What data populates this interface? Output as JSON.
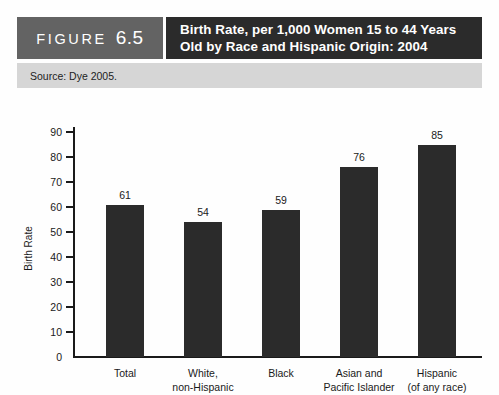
{
  "figure": {
    "word": "FIGURE",
    "number": "6.5",
    "title_line1": "Birth Rate, per 1,000 Women 15 to 44 Years",
    "title_line2": "Old by Race and Hispanic Origin: 2004"
  },
  "source": {
    "text": "Source: Dye 2005."
  },
  "colors": {
    "figure_box": "#636363",
    "title_box": "#2b2b2b",
    "source_band": "#d6d6d6",
    "bar": "#2b2b2b",
    "axis": "#1a1a1a"
  },
  "chart_data": {
    "type": "bar",
    "title": "Birth Rate, per 1,000 Women 15 to 44 Years Old by Race and Hispanic Origin: 2004",
    "categories": [
      "Total",
      "White,\nnon-Hispanic",
      "Black",
      "Asian and\nPacific Islander",
      "Hispanic\n(of any race)"
    ],
    "category_lines": [
      [
        "Total"
      ],
      [
        "White,",
        "non-Hispanic"
      ],
      [
        "Black"
      ],
      [
        "Asian and",
        "Pacific Islander"
      ],
      [
        "Hispanic",
        "(of any race)"
      ]
    ],
    "values": [
      61,
      54,
      59,
      76,
      85
    ],
    "value_labels": [
      "61",
      "54",
      "59",
      "76",
      "85"
    ],
    "xlabel": "",
    "ylabel": "Birth Rate",
    "ylim": [
      0,
      90
    ],
    "ytick_values": [
      0,
      10,
      20,
      30,
      40,
      50,
      60,
      70,
      80,
      90
    ],
    "ytick_labels": [
      "0",
      "10",
      "20",
      "30",
      "40",
      "50",
      "60",
      "70",
      "80",
      "90"
    ],
    "grid": false,
    "legend": null
  }
}
